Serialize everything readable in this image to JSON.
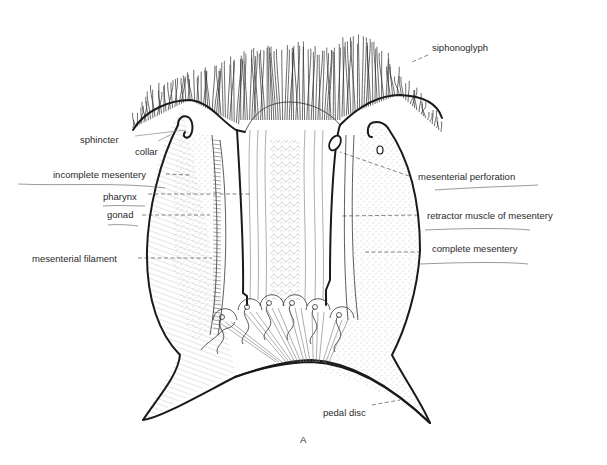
{
  "figure": {
    "panel_letter": "A"
  },
  "labels": {
    "siphonoglyph": "siphonoglyph",
    "sphincter": "sphincter",
    "collar": "collar",
    "incomplete_mesentery": "incomplete mesentery",
    "pharynx": "pharynx",
    "gonad": "gonad",
    "mesenterial_filament": "mesenterial filament",
    "mesenterial_perforation": "mesenterial perforation",
    "retractor_muscle": "retractor muscle of mesentery",
    "complete_mesentery": "complete mesentery",
    "pedal_disc": "pedal disc"
  },
  "colors": {
    "ink": "#1a1a1a",
    "paper": "#ffffff",
    "stipple": "#8a8a8a"
  }
}
